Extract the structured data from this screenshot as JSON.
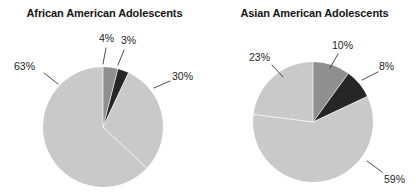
{
  "figure": {
    "background": "#ffffff",
    "ink": "#242424"
  },
  "palette": {
    "light_gray": "#c9c9c9",
    "medium_gray": "#8f8f8f",
    "dark": "#262626",
    "separator": "#ffffff",
    "leader_line": "#3a3a3a",
    "title": "#141414"
  },
  "chart_data": [
    {
      "type": "pie",
      "title": "African American Adolescents",
      "xlabel": "",
      "ylabel": "",
      "legend_position": "none",
      "grid": false,
      "start_angle_deg": 0,
      "direction": "clockwise",
      "center": {
        "x": 103,
        "y": 127
      },
      "radius": 60,
      "categories": [
        "4%",
        "3%",
        "30%",
        "63%"
      ],
      "values": [
        4,
        3,
        30,
        63
      ],
      "slices": [
        {
          "label": "4%",
          "value": 4,
          "color": "#8f8f8f",
          "start_deg": 0,
          "end_deg": 14.4,
          "label_x": 99,
          "label_y": 32,
          "leader": {
            "x1": 106,
            "y1": 48,
            "x2": 103,
            "y2": 64
          }
        },
        {
          "label": "3%",
          "value": 3,
          "color": "#262626",
          "start_deg": 14.4,
          "end_deg": 25.2,
          "label_x": 121,
          "label_y": 34,
          "leader": {
            "x1": 124,
            "y1": 50,
            "x2": 118,
            "y2": 65
          }
        },
        {
          "label": "30%",
          "value": 30,
          "color": "#c9c9c9",
          "start_deg": 25.2,
          "end_deg": 133.2,
          "label_x": 172,
          "label_y": 70,
          "leader": {
            "x1": 170,
            "y1": 81,
            "x2": 154,
            "y2": 88
          }
        },
        {
          "label": "63%",
          "value": 63,
          "color": "#c9c9c9",
          "start_deg": 133.2,
          "end_deg": 360,
          "label_x": 14,
          "label_y": 60,
          "leader": {
            "x1": 44,
            "y1": 73,
            "x2": 58,
            "y2": 84
          }
        }
      ]
    },
    {
      "type": "pie",
      "title": "Asian American Adolescents",
      "xlabel": "",
      "ylabel": "",
      "legend_position": "none",
      "grid": false,
      "start_angle_deg": 0,
      "direction": "clockwise",
      "center": {
        "x": 103,
        "y": 122
      },
      "radius": 60,
      "categories": [
        "10%",
        "8%",
        "59%",
        "23%"
      ],
      "values": [
        10,
        8,
        59,
        23
      ],
      "slices": [
        {
          "label": "10%",
          "value": 10,
          "color": "#8f8f8f",
          "start_deg": 0,
          "end_deg": 36,
          "label_x": 122,
          "label_y": 39,
          "leader": {
            "x1": 128,
            "y1": 54,
            "x2": 120,
            "y2": 68
          }
        },
        {
          "label": "8%",
          "value": 8,
          "color": "#262626",
          "start_deg": 36,
          "end_deg": 64.8,
          "label_x": 169,
          "label_y": 60,
          "leader": {
            "x1": 168,
            "y1": 72,
            "x2": 152,
            "y2": 80
          }
        },
        {
          "label": "59%",
          "value": 59,
          "color": "#c9c9c9",
          "start_deg": 64.8,
          "end_deg": 277.2,
          "label_x": 174,
          "label_y": 173,
          "leader": {
            "x1": 172,
            "y1": 172,
            "x2": 157,
            "y2": 161
          }
        },
        {
          "label": "23%",
          "value": 23,
          "color": "#c9c9c9",
          "start_deg": 277.2,
          "end_deg": 360,
          "label_x": 39,
          "label_y": 51,
          "leader": {
            "x1": 62,
            "y1": 65,
            "x2": 73,
            "y2": 77
          }
        }
      ]
    }
  ]
}
